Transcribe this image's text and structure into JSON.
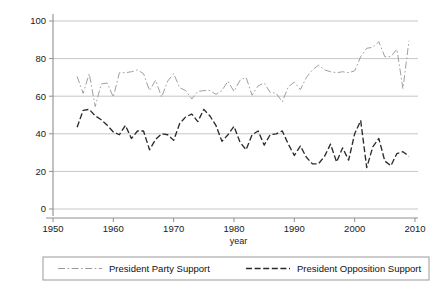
{
  "chart_data": {
    "type": "line",
    "title": "",
    "subtitle": "",
    "xlabel": "year",
    "ylabel": "",
    "xlim": [
      1948,
      2012
    ],
    "ylim": [
      -4,
      104
    ],
    "xticks": [
      1950,
      1960,
      1970,
      1980,
      1990,
      2000,
      2010
    ],
    "xtick_labels": [
      "1950",
      "1960",
      "1970",
      "1980",
      "1990",
      "2000",
      "2010"
    ],
    "yticks": [
      0,
      20,
      40,
      60,
      80,
      100
    ],
    "ytick_labels": [
      "0",
      "20",
      "40",
      "60",
      "80",
      "100"
    ],
    "grid": "horizontal",
    "legend_position": "below-outside",
    "legend_entries": [
      "President Party Support",
      "President Opposition Support"
    ],
    "colors": {
      "president_party_support": "#9a9a9a",
      "president_opposition_support": "#2b2b2b",
      "gridline": "#b9b9b9",
      "axis": "#8f8f8f",
      "background": "#ffffff"
    },
    "x": [
      1954,
      1955,
      1956,
      1957,
      1958,
      1959,
      1960,
      1961,
      1962,
      1963,
      1964,
      1965,
      1966,
      1967,
      1968,
      1969,
      1970,
      1971,
      1972,
      1973,
      1974,
      1975,
      1976,
      1977,
      1978,
      1979,
      1980,
      1981,
      1982,
      1983,
      1984,
      1985,
      1986,
      1987,
      1988,
      1989,
      1990,
      1991,
      1992,
      1993,
      1994,
      1995,
      1996,
      1997,
      1998,
      1999,
      2000,
      2001,
      2002,
      2003,
      2004,
      2005,
      2006,
      2007,
      2008,
      2009
    ],
    "series": [
      {
        "name": "President Party Support",
        "linestyle": "dashdot",
        "color": "#9a9a9a",
        "values": [
          70.5,
          61.5,
          72.0,
          54.5,
          66.5,
          67.0,
          59.5,
          72.5,
          72.5,
          73.0,
          74.0,
          72.0,
          63.0,
          68.5,
          59.5,
          68.0,
          72.0,
          64.5,
          63.0,
          58.5,
          62.5,
          63.0,
          63.0,
          61.0,
          63.0,
          68.0,
          62.5,
          68.5,
          70.0,
          60.5,
          65.5,
          67.0,
          62.0,
          61.5,
          57.0,
          65.0,
          67.5,
          63.5,
          70.0,
          74.0,
          76.5,
          74.0,
          73.0,
          72.5,
          73.0,
          72.5,
          73.5,
          81.0,
          85.5,
          86.0,
          89.0,
          81.0,
          81.0,
          85.0,
          64.0,
          89.5
        ]
      },
      {
        "name": "President Opposition Support",
        "linestyle": "dashed",
        "color": "#2b2b2b",
        "values": [
          43.5,
          52.5,
          53.0,
          49.5,
          47.5,
          44.5,
          41.0,
          39.5,
          44.5,
          37.5,
          41.5,
          41.5,
          31.5,
          37.0,
          40.0,
          39.5,
          36.5,
          45.5,
          49.0,
          50.5,
          46.5,
          53.0,
          49.5,
          44.5,
          36.0,
          39.5,
          44.0,
          35.5,
          31.5,
          39.5,
          41.5,
          34.0,
          39.5,
          40.0,
          41.5,
          34.5,
          28.5,
          33.5,
          27.5,
          24.0,
          24.0,
          28.0,
          34.5,
          25.0,
          32.5,
          26.0,
          40.0,
          47.0,
          22.0,
          33.0,
          37.5,
          25.5,
          23.0,
          29.5,
          30.5,
          28.0
        ]
      }
    ]
  },
  "legend": {
    "entries": [
      {
        "label": "President Party Support",
        "swatch": "dashdot-line-swatch"
      },
      {
        "label": "President Opposition Support",
        "swatch": "dashed-line-swatch"
      }
    ]
  },
  "axes": {
    "x_title": "year"
  }
}
